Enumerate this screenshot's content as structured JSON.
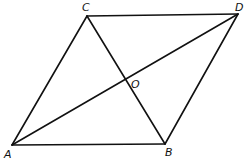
{
  "diagram": {
    "type": "parallelogram",
    "stroke_color": "#111111",
    "points": {
      "A": {
        "label": "A",
        "x": 12,
        "y": 145
      },
      "B": {
        "label": "B",
        "x": 165,
        "y": 144
      },
      "C": {
        "label": "C",
        "x": 87,
        "y": 16
      },
      "D": {
        "label": "D",
        "x": 238,
        "y": 14
      },
      "O": {
        "label": "O",
        "x": 126,
        "y": 81
      }
    },
    "segments": [
      [
        "A",
        "B"
      ],
      [
        "B",
        "D"
      ],
      [
        "D",
        "C"
      ],
      [
        "C",
        "A"
      ],
      [
        "A",
        "D"
      ],
      [
        "C",
        "B"
      ]
    ]
  }
}
